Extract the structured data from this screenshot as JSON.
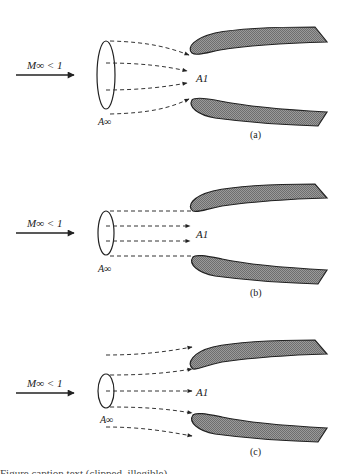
{
  "figure": {
    "colors": {
      "lip_fill": "#8a8a8a",
      "line": "#222222",
      "background": "#ffffff"
    },
    "panels": [
      {
        "id": "a",
        "caption": "(a)",
        "freestream_label": "M∞ < 1",
        "capture_area_label": "A∞",
        "inlet_area_label": "A1",
        "condition": "converging streamtube (A∞ > A1)"
      },
      {
        "id": "b",
        "caption": "(b)",
        "freestream_label": "M∞ < 1",
        "capture_area_label": "A∞",
        "inlet_area_label": "A1",
        "condition": "straight streamtube (A∞ = A1)"
      },
      {
        "id": "c",
        "caption": "(c)",
        "freestream_label": "M∞ < 1",
        "capture_area_label": "A∞",
        "inlet_area_label": "A1",
        "condition": "diverging streamtube (A∞ < A1)"
      }
    ],
    "bottom_caption_clipped": "Figure caption text (clipped, illegible)"
  }
}
